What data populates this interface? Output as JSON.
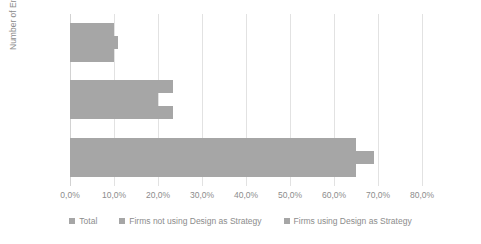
{
  "chart_data": {
    "type": "bar",
    "orientation": "horizontal",
    "title": "",
    "xlabel": "",
    "ylabel": "Number of Employees",
    "categories": [
      "10-49",
      "50-249",
      "+250"
    ],
    "series": [
      {
        "name": "Total",
        "values": [
          65.0,
          23.5,
          10.0
        ]
      },
      {
        "name": "Firms not using Design as Strategy",
        "values": [
          69.0,
          20.0,
          11.0
        ]
      },
      {
        "name": "Firms using Design as Strategy",
        "values": [
          65.0,
          23.5,
          10.0
        ]
      }
    ],
    "xlim": [
      0,
      80
    ],
    "xticks": [
      0,
      10,
      20,
      30,
      40,
      50,
      60,
      70,
      80
    ],
    "xtick_labels": [
      "0,0%",
      "10,0%",
      "20,0%",
      "30,0%",
      "40,0%",
      "50,0%",
      "60,0%",
      "70,0%",
      "80,0%"
    ],
    "grid": true,
    "legend_position": "bottom",
    "bar_color": "#a6a6a6",
    "grid_color": "#e2e2e2",
    "text_color": "#8c8c8c"
  },
  "axis": {
    "y_title": "Number of Employees"
  }
}
